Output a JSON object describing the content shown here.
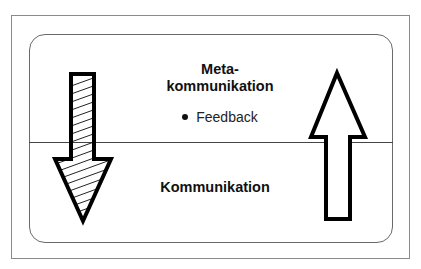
{
  "diagram": {
    "upper_section": {
      "title_line1": "Meta-",
      "title_line2": "kommunikation",
      "bullets": [
        "Feedback"
      ]
    },
    "lower_section": {
      "title": "Kommunikation"
    },
    "arrows": [
      {
        "direction": "down",
        "fill": "hatched",
        "position": "left"
      },
      {
        "direction": "up",
        "fill": "hollow",
        "position": "right"
      }
    ],
    "colors": {
      "stroke": "#000000",
      "frame": "#8a8a8a",
      "background": "#ffffff"
    }
  }
}
